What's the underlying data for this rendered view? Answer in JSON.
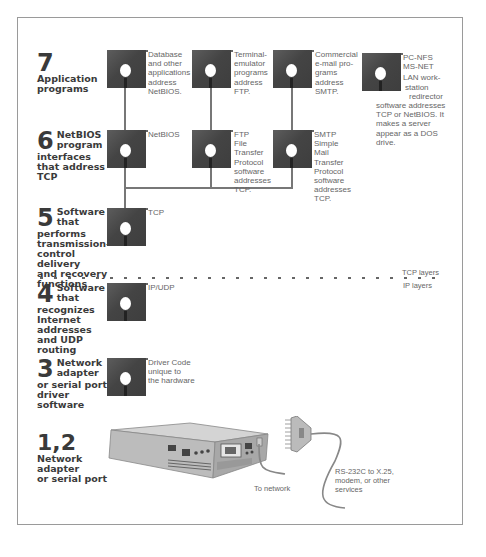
{
  "layers": [
    {
      "number": "7",
      "label_lines": [
        "Application",
        "programs"
      ]
    },
    {
      "number": "6",
      "label_lines": [
        "NetBIOS",
        "program",
        "interfaces",
        "that address",
        "TCP"
      ]
    },
    {
      "number": "5",
      "label_lines": [
        "Software",
        "that",
        "performs",
        "transmission-",
        "control delivery",
        "and recovery",
        "functions"
      ]
    },
    {
      "number": "4",
      "label_lines": [
        "Software",
        "that",
        "recognizes",
        "Internet",
        "addresses",
        "and UDP",
        "routing"
      ]
    },
    {
      "number": "3",
      "label_lines": [
        "Network",
        "adapter",
        "or serial port",
        "driver software"
      ]
    },
    {
      "number": "1,2",
      "label_lines": [
        "Network",
        "adapter",
        "or serial port"
      ]
    }
  ],
  "disks": {
    "app_database": [
      "Database",
      "and other",
      "applications",
      "address",
      "NetBIOS."
    ],
    "app_terminal": [
      "Terminal-",
      "emulator",
      "programs",
      "address",
      "FTP."
    ],
    "app_email": [
      "Commercial",
      "e-mail pro-",
      "grams",
      "address",
      "SMTP."
    ],
    "app_pcnfs": [
      "PC-NFS",
      "MS-NET",
      "LAN work-",
      "station",
      "redirector",
      "software addresses",
      "TCP or NetBIOS. It",
      "makes a server",
      "appear as a DOS",
      "drive."
    ],
    "netbios": [
      "NetBIOS"
    ],
    "ftp": [
      "FTP",
      "File",
      "Transfer",
      "Protocol",
      "software",
      "addresses",
      "TCP."
    ],
    "smtp": [
      "SMTP",
      "Simple",
      "Mail",
      "Transfer",
      "Protocol",
      "software",
      "addresses",
      "TCP."
    ],
    "tcp": [
      "TCP"
    ],
    "ipudp": [
      "IP/UDP"
    ],
    "driver": [
      "Driver Code",
      "unique to",
      "the hardware"
    ]
  },
  "boundary": {
    "upper": "TCP layers",
    "lower": "IP layers"
  },
  "captions": {
    "to_network": "To network",
    "serial": [
      "RS-232C to X.25,",
      "modem, or other",
      "services"
    ]
  },
  "colors": {
    "disk": "#444444",
    "line": "#777777",
    "text": "#666666",
    "heading": "#3a3a3a"
  }
}
